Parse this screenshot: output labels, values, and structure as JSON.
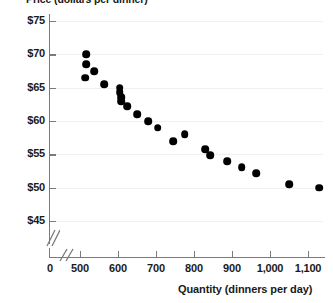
{
  "chart_data": {
    "type": "scatter",
    "title": "",
    "xlabel": "Quantity (dinners per day)",
    "ylabel": "Price (dollars per dinner)",
    "xlim": [
      450,
      1150
    ],
    "ylim": [
      43.5,
      76
    ],
    "grid": true,
    "legend": null,
    "axis_break": {
      "x": true,
      "y": true,
      "note": "double-slash break marks on both axes near the origin"
    },
    "x_ticks": [
      {
        "value": 0,
        "label": "0"
      },
      {
        "value": 500,
        "label": "500"
      },
      {
        "value": 600,
        "label": "600"
      },
      {
        "value": 700,
        "label": "700"
      },
      {
        "value": 800,
        "label": "800"
      },
      {
        "value": 900,
        "label": "900"
      },
      {
        "value": 1000,
        "label": "1,000"
      },
      {
        "value": 1100,
        "label": "1,100"
      }
    ],
    "y_ticks": [
      {
        "value": 75,
        "label": "$75"
      },
      {
        "value": 70,
        "label": "$70"
      },
      {
        "value": 65,
        "label": "$65"
      },
      {
        "value": 60,
        "label": "$60"
      },
      {
        "value": 55,
        "label": "$55"
      },
      {
        "value": 50,
        "label": "$50"
      },
      {
        "value": 45,
        "label": "$45"
      }
    ],
    "points": [
      {
        "x": 516,
        "y": 70.0
      },
      {
        "x": 516,
        "y": 68.5
      },
      {
        "x": 537,
        "y": 67.5
      },
      {
        "x": 513,
        "y": 66.5
      },
      {
        "x": 563,
        "y": 65.5
      },
      {
        "x": 605,
        "y": 65.0
      },
      {
        "x": 605,
        "y": 64.3
      },
      {
        "x": 608,
        "y": 63.6
      },
      {
        "x": 608,
        "y": 63.0
      },
      {
        "x": 624,
        "y": 62.2
      },
      {
        "x": 650,
        "y": 61.0
      },
      {
        "x": 679,
        "y": 60.0
      },
      {
        "x": 705,
        "y": 59.0
      },
      {
        "x": 745,
        "y": 57.0
      },
      {
        "x": 776,
        "y": 58.0
      },
      {
        "x": 829,
        "y": 55.8
      },
      {
        "x": 842,
        "y": 54.9
      },
      {
        "x": 887,
        "y": 54.0
      },
      {
        "x": 926,
        "y": 53.1
      },
      {
        "x": 963,
        "y": 52.2
      },
      {
        "x": 1050,
        "y": 50.5
      },
      {
        "x": 1129,
        "y": 50.0
      }
    ]
  }
}
